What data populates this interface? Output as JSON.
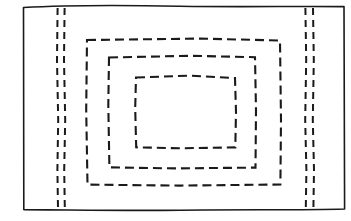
{
  "figure": {
    "kind": "hand-drawn-line-diagram",
    "background_color": "#ffffff",
    "ink_color": "#1a1a1a",
    "canvas": {
      "width": 351,
      "height": 221
    },
    "labels": [],
    "title": "",
    "caption": ""
  },
  "outer_frame": {
    "name": "outer-boundary-rectangle",
    "style": "solid",
    "hand_drawn": true,
    "stroke_width": 1.6,
    "bounds": {
      "left": 23,
      "top": 6,
      "right": 345,
      "bottom": 210
    },
    "path": "M 23.5,7.5 C 60,5.4 120,5.0 180,6.2 C 240,7.2 300,6.0 344.0,6.6 L 344.6,209.0 C 300,210.4 240,209.2 180,210.2 C 120,211.0 60,209.6 23.8,209.6 Z"
  },
  "concentric_rings": [
    {
      "name": "dashed-rectangle-ring-1",
      "order": 1,
      "style": "dashed",
      "stroke_width": 2.1,
      "dash_pattern": "9 5",
      "bounds": {
        "left": 86,
        "top": 39,
        "right": 281,
        "bottom": 185
      },
      "path": "M 87,40 L 200,38.6 L 280,40.5 L 281,120 L 280.4,184.5 L 180,185.6 L 87.5,184.6 L 86.2,110 Z"
    },
    {
      "name": "dashed-rectangle-ring-2",
      "order": 2,
      "style": "dashed",
      "stroke_width": 2.1,
      "dash_pattern": "9 5",
      "bounds": {
        "left": 108,
        "top": 56,
        "right": 256,
        "bottom": 168
      },
      "path": "M 109,57.5 L 190,55.8 L 255,57.2 L 256,110 L 255.5,167.6 L 175,168.4 L 109.4,167.4 L 108.3,105 Z"
    },
    {
      "name": "dashed-rectangle-ring-3",
      "order": 3,
      "style": "dashed",
      "stroke_width": 2.1,
      "dash_pattern": "9 5",
      "bounds": {
        "left": 135,
        "top": 76,
        "right": 236,
        "bottom": 148
      },
      "path": "M 136,77.5 L 190,75.6 L 235,78.0 L 236,112 L 235.3,147.4 L 180,148.3 L 136.2,147.3 L 135.2,108 Z"
    }
  ],
  "vertical_dashed_pairs": [
    {
      "name": "left-dashed-line-pair",
      "side": "left",
      "style": "dashed",
      "stroke_width": 2.0,
      "dash_pattern": "7 5",
      "lines": [
        {
          "name": "left-dashed-line-inner",
          "path": "M 57.6,8 L 57.0,60 L 58.2,120 L 57.4,170 L 58.0,208"
        },
        {
          "name": "left-dashed-line-outer",
          "path": "M 64.6,8 L 64.0,60 L 65.2,120 L 64.2,170 L 64.8,208"
        }
      ]
    },
    {
      "name": "right-dashed-line-pair",
      "side": "right",
      "style": "dashed",
      "stroke_width": 2.0,
      "dash_pattern": "7 5",
      "lines": [
        {
          "name": "right-dashed-line-inner",
          "path": "M 305.4,8 L 306.2,60 L 305.2,120 L 306.4,170 L 305.8,208"
        },
        {
          "name": "right-dashed-line-outer",
          "path": "M 313.0,8 L 313.8,60 L 312.8,120 L 314.0,170 L 313.4,208"
        }
      ]
    }
  ]
}
